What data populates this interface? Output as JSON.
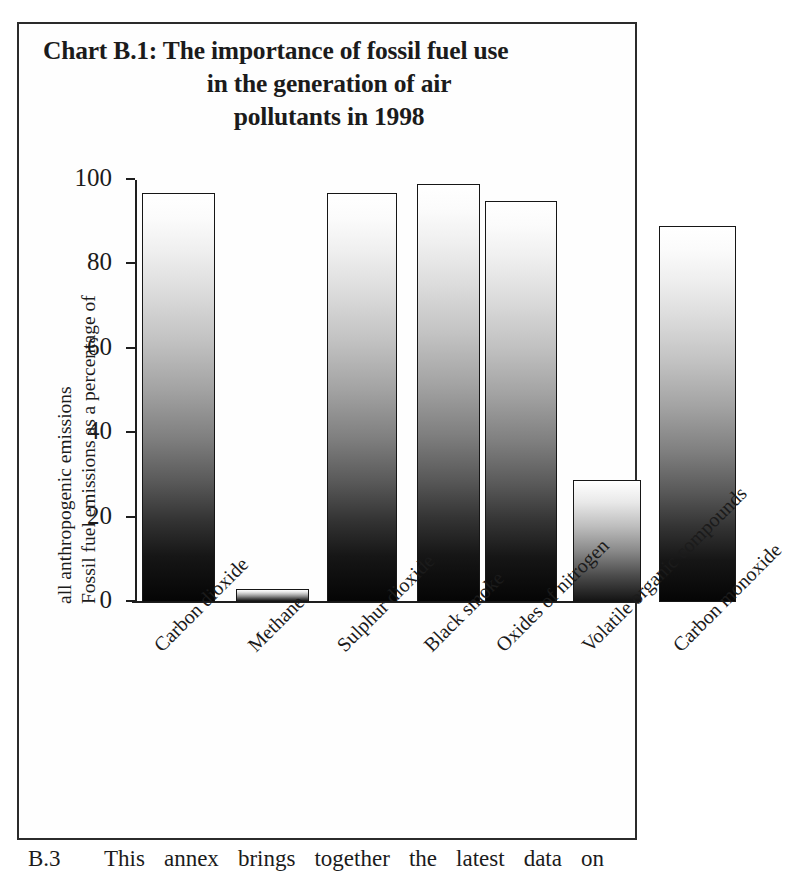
{
  "figure": {
    "title_lines": [
      "Chart B.1: The importance of fossil fuel use",
      "in the generation of air",
      "pollutants in 1998"
    ],
    "y_axis_title_lines": [
      "Fossil fuel emissions as a percentage of",
      "all anthropogenic emissions"
    ]
  },
  "chart_data": {
    "type": "bar",
    "title": "Chart B.1: The importance of fossil fuel use in the generation of air pollutants in 1998",
    "xlabel": "",
    "ylabel": "Fossil fuel emissions as a percentage of all anthropogenic emissions",
    "categories": [
      "Carbon dioxide",
      "Methane",
      "Sulphur dioxide",
      "Black smoke",
      "Oxides of nitrogen",
      "Volatile organic compounds",
      "Carbon monoxide"
    ],
    "values": [
      97,
      3,
      97,
      99,
      95,
      29,
      89
    ],
    "ylim": [
      0,
      100
    ],
    "yticks": [
      0,
      20,
      40,
      60,
      80,
      100
    ],
    "ytick_labels": [
      "0",
      "20",
      "40",
      "60",
      "80",
      "100"
    ],
    "grid": false,
    "legend": null,
    "bar_fill": "vertical gradient white-to-black",
    "bar_outline_color": "#161616"
  },
  "body": {
    "paragraph_number": "B.3",
    "paragraph_text": "This annex brings together the latest data on"
  }
}
